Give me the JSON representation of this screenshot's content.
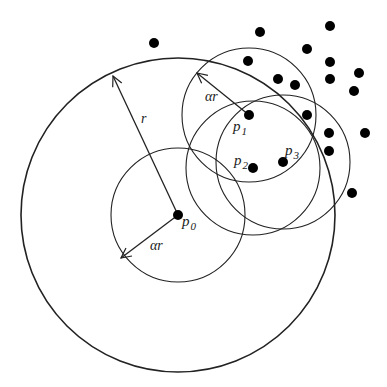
{
  "diagram": {
    "colors": {
      "stroke": "#222222",
      "dot": "#000000",
      "background": "#ffffff"
    },
    "big_circle": {
      "cx": 178,
      "cy": 215,
      "r": 157
    },
    "radius_label": {
      "text": "r",
      "x": 141,
      "y": 123
    },
    "small_radius": 67,
    "nodes": [
      {
        "id": "p0",
        "x": 178,
        "y": 215,
        "label": "p",
        "sub": "0",
        "lx": 182,
        "ly": 226
      },
      {
        "id": "p1",
        "x": 249,
        "y": 115,
        "label": "p",
        "sub": "1",
        "lx": 233,
        "ly": 131
      },
      {
        "id": "p2",
        "x": 253,
        "y": 168,
        "label": "p",
        "sub": "2",
        "lx": 234,
        "ly": 165
      },
      {
        "id": "p3",
        "x": 283,
        "y": 162,
        "label": "p",
        "sub": "3",
        "lx": 285,
        "ly": 155
      }
    ],
    "alpha_labels": [
      {
        "text": "αr",
        "x": 205,
        "y": 101
      },
      {
        "text": "αr",
        "x": 150,
        "y": 250
      }
    ],
    "other_points": [
      [
        154,
        43
      ],
      [
        260,
        32
      ],
      [
        330,
        26
      ],
      [
        307,
        49
      ],
      [
        248,
        61
      ],
      [
        330,
        62
      ],
      [
        278,
        79
      ],
      [
        295,
        85
      ],
      [
        330,
        79
      ],
      [
        359,
        73
      ],
      [
        354,
        91
      ],
      [
        307,
        115
      ],
      [
        329,
        133
      ],
      [
        365,
        133
      ],
      [
        329,
        151
      ],
      [
        352,
        193
      ]
    ]
  }
}
